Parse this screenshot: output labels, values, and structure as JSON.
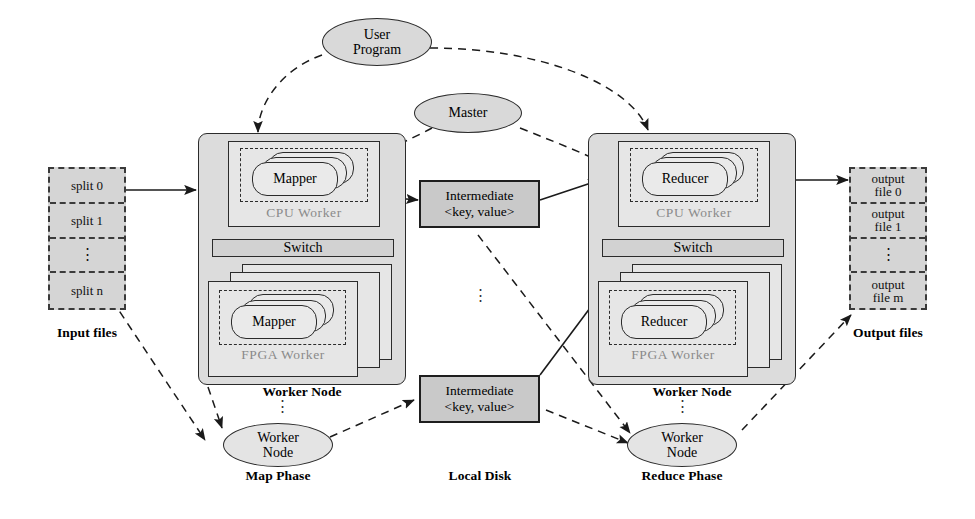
{
  "diagram": {
    "colors": {
      "fill_gray": "#d5d5d5",
      "box_fill": "#dcdcdc",
      "intermediate_fill": "#c9c9c9",
      "ellipse_fill": "#d9d9d9",
      "stroke": "#2b2b2b",
      "tier_text": "#8a8a8a"
    }
  },
  "input_files": {
    "caption": "Input files",
    "cells": [
      "split 0",
      "split 1",
      "⋮",
      "split n"
    ]
  },
  "output_files": {
    "caption": "Output files",
    "cells": [
      "output\nfile 0",
      "output\nfile 1",
      "⋮",
      "output\nfile m"
    ]
  },
  "user_program": {
    "label": "User\nProgram"
  },
  "master": {
    "label": "Master"
  },
  "map_side": {
    "phase_caption": "Map Phase",
    "worker_node_caption": "Worker Node",
    "cpu_worker_label": "CPU  Worker",
    "fpga_worker_label": "FPGA  Worker",
    "switch_label": "Switch",
    "cpu_task_label": "Mapper",
    "fpga_task_label": "Mapper",
    "ellipsis": "⋮",
    "bottom_node_label": "Worker\nNode"
  },
  "reduce_side": {
    "phase_caption": "Reduce Phase",
    "worker_node_caption": "Worker Node",
    "cpu_worker_label": "CPU  Worker",
    "fpga_worker_label": "FPGA  Worker",
    "switch_label": "Switch",
    "cpu_task_label": "Reducer",
    "fpga_task_label": "Reducer",
    "ellipsis": "⋮",
    "bottom_node_label": "Worker\nNode"
  },
  "local_disk": {
    "caption": "Local Disk",
    "ellipsis": "⋮",
    "boxes": [
      {
        "line1": "Intermediate",
        "line2": "<key, value>"
      },
      {
        "line1": "Intermediate",
        "line2": "<key, value>"
      }
    ]
  }
}
